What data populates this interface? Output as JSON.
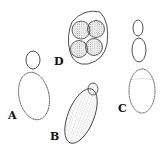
{
  "figure": {
    "panels": [
      {
        "id": "A",
        "label": "A",
        "content": "oval cell with single small bud"
      },
      {
        "id": "B",
        "label": "B",
        "content": "elongated stippled cell with small bud"
      },
      {
        "id": "C",
        "label": "C",
        "content": "chain of budding cells"
      },
      {
        "id": "D",
        "label": "D",
        "content": "ascus containing four ascospores"
      }
    ]
  },
  "colors": {
    "ink": "#1a1a1a",
    "background": "#ffffff"
  }
}
